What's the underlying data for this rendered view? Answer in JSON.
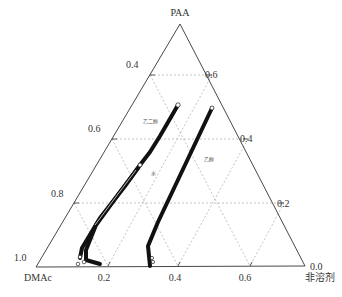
{
  "diagram": {
    "type": "ternary-phase-diagram",
    "vertices": {
      "top": {
        "label": "PAA",
        "x": 180,
        "y": 24
      },
      "left": {
        "label": "DMAc",
        "x": 36,
        "y": 267
      },
      "right": {
        "label": "非溶剂",
        "x": 305,
        "y": 266
      }
    },
    "left_axis_ticks": [
      {
        "label": "0.4",
        "x": 126,
        "y": 68
      },
      {
        "label": "0.6",
        "x": 88,
        "y": 132
      },
      {
        "label": "0.8",
        "x": 51,
        "y": 196
      },
      {
        "label": "1.0",
        "x": 14,
        "y": 260
      }
    ],
    "right_axis_ticks": [
      {
        "label": "0.6",
        "x": 205,
        "y": 75
      },
      {
        "label": "0.4",
        "x": 240,
        "y": 139
      },
      {
        "label": "0.2",
        "x": 277,
        "y": 205
      },
      {
        "label": "0.0",
        "x": 310,
        "y": 267
      }
    ],
    "bottom_axis_ticks": [
      {
        "label": "0.2",
        "x": 104,
        "y": 281
      },
      {
        "label": "0.4",
        "x": 175,
        "y": 281
      },
      {
        "label": "0.6",
        "x": 245,
        "y": 281
      }
    ],
    "curve_labels": [
      {
        "label": "乙二醇",
        "x": 143,
        "y": 123
      },
      {
        "label": "水",
        "x": 151,
        "y": 173
      },
      {
        "label": "乙醇",
        "x": 204,
        "y": 159
      }
    ],
    "series": [
      {
        "name": "乙二醇",
        "points": "178,105 150,152 140,165"
      },
      {
        "name": "水",
        "points": "140,165 125,186 100,218 82,248 80,258"
      },
      {
        "name": "水-2",
        "points": "138,168 120,192 96,225 86,250 86,260"
      },
      {
        "name": "水-3",
        "points": "86,260 100,264"
      },
      {
        "name": "乙醇",
        "points": "212,108 185,165 158,222 148,246 150,266"
      }
    ]
  }
}
